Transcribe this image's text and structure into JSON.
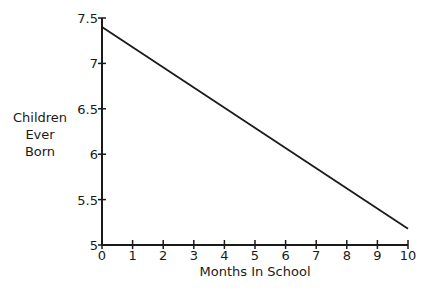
{
  "chart_data": {
    "type": "line",
    "title": "",
    "xlabel": "Months In School",
    "ylabel": "Children Ever Born",
    "ylabel_lines": [
      "Children",
      "Ever",
      "Born"
    ],
    "x": [
      0,
      10
    ],
    "series": [
      {
        "name": "Children Ever Born",
        "values": [
          7.4,
          5.18
        ]
      }
    ],
    "xlim": [
      0,
      10
    ],
    "ylim": [
      5,
      7.5
    ],
    "x_ticks": [
      "0",
      "1",
      "2",
      "3",
      "4",
      "5",
      "6",
      "7",
      "8",
      "9",
      "10"
    ],
    "y_ticks": [
      "5",
      "5.5",
      "6",
      "6.5",
      "7",
      "7.5"
    ],
    "grid": false,
    "legend": "none",
    "colors": {
      "line": "#1a1a1a",
      "axis": "#1a1a1a",
      "background": "#ffffff"
    }
  }
}
